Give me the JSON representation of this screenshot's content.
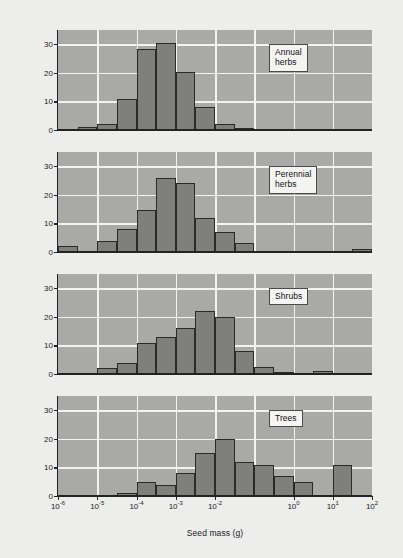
{
  "figure": {
    "background_color": "#ededeb",
    "plot_background_color": "#a9a9a7",
    "bar_fill_color": "#7f7f7e",
    "bar_edge_color": "#2a2a2a",
    "gridline_color": "#f2f2f0",
    "axis_color": "#232323"
  },
  "axes": {
    "ylabel": "Species (%)",
    "xlabel": "Seed mass (g)",
    "ytick_labels": [
      "0",
      "10",
      "20",
      "30"
    ],
    "ytick_values": [
      0,
      10,
      20,
      30
    ],
    "ylim": [
      0,
      35
    ],
    "xtick_labels": [
      "10-6",
      "10-5",
      "10-4",
      "10-3",
      "10-2",
      "100",
      "101",
      "102"
    ],
    "xtick_bases": [
      "10",
      "10",
      "10",
      "10",
      "10",
      "10",
      "10",
      "10"
    ],
    "xtick_exponents": [
      "-6",
      "-5",
      "-4",
      "-3",
      "-2",
      "0",
      "1",
      "2"
    ],
    "xtick_log_values": [
      -6,
      -5,
      -4,
      -3,
      -2,
      0,
      1,
      2
    ],
    "xlim_log": [
      -6,
      2
    ],
    "grid": "on",
    "legend_position": "inside-panel-right"
  },
  "chart_data": [
    {
      "type": "bar",
      "title": "Annual\nherbs",
      "panel_label": "Annual\nherbs",
      "xlabel": "Seed mass (g)",
      "ylabel": "Species (%)",
      "ylim": [
        0,
        35
      ],
      "xlim_log": [
        -6,
        2
      ],
      "bin_width_decades": 0.5,
      "bin_left_log": [
        -6.0,
        -5.5,
        -5.0,
        -4.5,
        -4.0,
        -3.5,
        -3.0,
        -2.5,
        -2.0,
        -1.5,
        -1.0,
        -0.5,
        0.0,
        0.5,
        1.0,
        1.5
      ],
      "categories": [
        "10^-6 to 10^-5.5",
        "10^-5.5 to 10^-5",
        "10^-5 to 10^-4.5",
        "10^-4.5 to 10^-4",
        "10^-4 to 10^-3.5",
        "10^-3.5 to 10^-3",
        "10^-3 to 10^-2.5",
        "10^-2.5 to 10^-2",
        "10^-2 to 10^-1.5",
        "10^-1.5 to 10^-1",
        "10^-1 to 10^-0.5",
        "10^-0.5 to 10^0",
        "10^0 to 10^0.5",
        "10^0.5 to 10^1",
        "10^1 to 10^1.5",
        "10^1.5 to 10^2"
      ],
      "values": [
        0,
        1,
        2,
        11,
        28.5,
        30.5,
        20.3,
        8.2,
        2,
        0.7,
        0,
        0,
        0,
        0,
        0,
        0
      ]
    },
    {
      "type": "bar",
      "title": "Perennial\nherbs",
      "panel_label": "Perennial\nherbs",
      "xlabel": "Seed mass (g)",
      "ylabel": "Species (%)",
      "ylim": [
        0,
        35
      ],
      "xlim_log": [
        -6,
        2
      ],
      "bin_width_decades": 0.5,
      "bin_left_log": [
        -6.0,
        -5.5,
        -5.0,
        -4.5,
        -4.0,
        -3.5,
        -3.0,
        -2.5,
        -2.0,
        -1.5,
        -1.0,
        -0.5,
        0.0,
        0.5,
        1.0,
        1.5
      ],
      "categories": [
        "10^-6 to 10^-5.5",
        "10^-5.5 to 10^-5",
        "10^-5 to 10^-4.5",
        "10^-4.5 to 10^-4",
        "10^-4 to 10^-3.5",
        "10^-3.5 to 10^-3",
        "10^-3 to 10^-2.5",
        "10^-2.5 to 10^-2",
        "10^-2 to 10^-1.5",
        "10^-1.5 to 10^-1",
        "10^-1 to 10^-0.5",
        "10^-0.5 to 10^0",
        "10^0 to 10^0.5",
        "10^0.5 to 10^1",
        "10^1 to 10^1.5",
        "10^1.5 to 10^2"
      ],
      "values": [
        2,
        0,
        4,
        8,
        14.8,
        26,
        24,
        12,
        7,
        3,
        0,
        0,
        0,
        0,
        0,
        1
      ]
    },
    {
      "type": "bar",
      "title": "Shrubs",
      "panel_label": "Shrubs",
      "xlabel": "Seed mass (g)",
      "ylabel": "Species (%)",
      "ylim": [
        0,
        35
      ],
      "xlim_log": [
        -6,
        2
      ],
      "bin_width_decades": 0.5,
      "bin_left_log": [
        -6.0,
        -5.5,
        -5.0,
        -4.5,
        -4.0,
        -3.5,
        -3.0,
        -2.5,
        -2.0,
        -1.5,
        -1.0,
        -0.5,
        0.0,
        0.5,
        1.0,
        1.5
      ],
      "categories": [
        "10^-6 to 10^-5.5",
        "10^-5.5 to 10^-5",
        "10^-5 to 10^-4.5",
        "10^-4.5 to 10^-4",
        "10^-4 to 10^-3.5",
        "10^-3.5 to 10^-3",
        "10^-3 to 10^-2.5",
        "10^-2.5 to 10^-2",
        "10^-2 to 10^-1.5",
        "10^-1.5 to 10^-1",
        "10^-1 to 10^-0.5",
        "10^-0.5 to 10^0",
        "10^0 to 10^0.5",
        "10^0.5 to 10^1",
        "10^1 to 10^1.5",
        "10^1.5 to 10^2"
      ],
      "values": [
        0,
        0,
        2,
        4,
        11,
        13,
        16,
        22,
        19.8,
        8,
        2.5,
        0.7,
        0,
        1.2,
        0,
        0
      ]
    },
    {
      "type": "bar",
      "title": "Trees",
      "panel_label": "Trees",
      "xlabel": "Seed mass (g)",
      "ylabel": "Species (%)",
      "ylim": [
        0,
        35
      ],
      "xlim_log": [
        -6,
        2
      ],
      "bin_width_decades": 0.5,
      "bin_left_log": [
        -6.0,
        -5.5,
        -5.0,
        -4.5,
        -4.0,
        -3.5,
        -3.0,
        -2.5,
        -2.0,
        -1.5,
        -1.0,
        -0.5,
        0.0,
        0.5,
        1.0,
        1.5
      ],
      "categories": [
        "10^-6 to 10^-5.5",
        "10^-5.5 to 10^-5",
        "10^-5 to 10^-4.5",
        "10^-4.5 to 10^-4",
        "10^-4 to 10^-3.5",
        "10^-3.5 to 10^-3",
        "10^-3 to 10^-2.5",
        "10^-2.5 to 10^-2",
        "10^-2 to 10^-1.5",
        "10^-1.5 to 10^-1",
        "10^-1 to 10^-0.5",
        "10^-0.5 to 10^0",
        "10^0 to 10^0.5",
        "10^0.5 to 10^1",
        "10^1 to 10^1.5",
        "10^1.5 to 10^2"
      ],
      "values": [
        0,
        0,
        0,
        1,
        5,
        4,
        8,
        15,
        19.8,
        12,
        11,
        7,
        4.8,
        0,
        11,
        0
      ]
    }
  ],
  "panels": [
    {
      "label": "Annual\nherbs",
      "top": 30,
      "height": 100
    },
    {
      "label": "Perennial\nherbs",
      "top": 152,
      "height": 100
    },
    {
      "label": "Shrubs",
      "top": 274,
      "height": 100
    },
    {
      "label": "Trees",
      "top": 396,
      "height": 100
    }
  ]
}
